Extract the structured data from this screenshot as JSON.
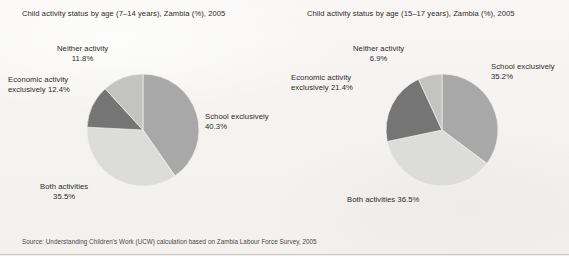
{
  "figure": {
    "background_color": "#f6f5f3",
    "source_note": "Source: Understanding Children's Work (UCW) calculation based on Zambia Labour Force Survey, 2005"
  },
  "palette": {
    "school_exclusively": "#a8a8a8",
    "both_activities": "#dcdcda",
    "economic_activity": "#757575",
    "neither_activity": "#c3c3c2",
    "slice_outline": "#f1f0ee",
    "text": "#2b2a29"
  },
  "chart_data": [
    {
      "type": "pie",
      "id": "left",
      "title": "Child activity status by age (7–14 years), Zambia (%), 2005",
      "xlabel": "",
      "ylabel": "",
      "legend_position": "callout-labels",
      "start_angle_deg": 0,
      "direction": "clockwise",
      "categories": [
        "School exclusively",
        "Both activities",
        "Economic activity exclusively",
        "Neither activity"
      ],
      "values": [
        40.3,
        35.5,
        12.4,
        11.8
      ],
      "colors": [
        "#a8a8a8",
        "#dcdcda",
        "#757575",
        "#c3c3c2"
      ],
      "labels": [
        {
          "name": "School exclusively",
          "line1": "School exclusively",
          "line2": "40.3%",
          "value": 40.3
        },
        {
          "name": "Both activities",
          "line1": "Both activities",
          "line2": "35.5%",
          "value": 35.5
        },
        {
          "name": "Economic activity",
          "line1": "Economic activity",
          "line2": "exclusively 12.4%",
          "value": 12.4
        },
        {
          "name": "Neither activity",
          "line1": "Neither activity",
          "line2": "11.8%",
          "value": 11.8
        }
      ]
    },
    {
      "type": "pie",
      "id": "right",
      "title": "Child activity status by age (15–17 years), Zambia (%), 2005",
      "xlabel": "",
      "ylabel": "",
      "legend_position": "callout-labels",
      "start_angle_deg": 0,
      "direction": "clockwise",
      "categories": [
        "School exclusively",
        "Both activities",
        "Economic activity exclusively",
        "Neither activity"
      ],
      "values": [
        35.2,
        36.5,
        21.4,
        6.9
      ],
      "colors": [
        "#a8a8a8",
        "#dcdcda",
        "#757575",
        "#c3c3c2"
      ],
      "labels": [
        {
          "name": "School exclusively",
          "line1": "School exclusively",
          "line2": "35.2%",
          "value": 35.2
        },
        {
          "name": "Both activities",
          "line1": "Both activities 36.5%",
          "line2": "",
          "value": 36.5
        },
        {
          "name": "Economic activity",
          "line1": "Economic activity",
          "line2": "exclusively 21.4%",
          "value": 21.4
        },
        {
          "name": "Neither activity",
          "line1": "Neither activity",
          "line2": "6.9%",
          "value": 6.9
        }
      ]
    }
  ]
}
